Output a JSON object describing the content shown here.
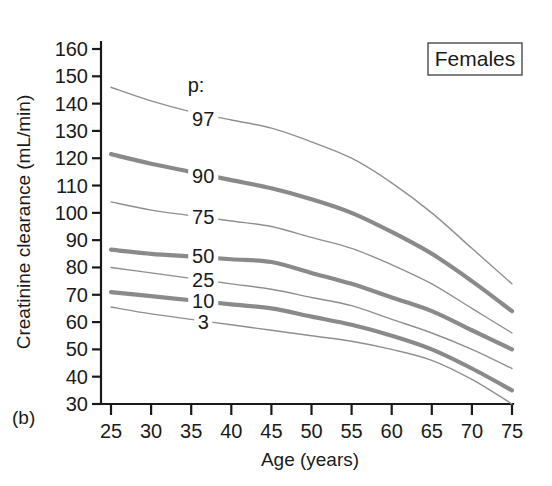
{
  "figure": {
    "panel_label": "(b)",
    "group_box_label": "Females",
    "percentile_header": "p:"
  },
  "chart_data": {
    "type": "line",
    "title": "",
    "subtitle": "",
    "xlabel": "Age (years)",
    "ylabel": "Creatinine clearance (mL/min)",
    "xlim": [
      25,
      75
    ],
    "ylim": [
      30,
      160
    ],
    "xticks": [
      25,
      30,
      35,
      40,
      45,
      50,
      55,
      60,
      65,
      70,
      75
    ],
    "yticks": [
      30,
      40,
      50,
      60,
      70,
      80,
      90,
      100,
      110,
      120,
      130,
      140,
      150,
      160
    ],
    "grid": false,
    "legend": "inline-curve-labels",
    "legend_position": "inline",
    "annotations": [
      "p:",
      "Females",
      "(b)"
    ],
    "x": [
      25,
      30,
      35,
      40,
      45,
      50,
      55,
      60,
      65,
      70,
      75
    ],
    "series": [
      {
        "name": "97",
        "label": "97",
        "emphasis": "thin",
        "color": "#8f8f8f",
        "values": [
          146,
          141,
          137,
          134,
          131,
          126,
          120,
          111,
          100,
          87,
          74
        ]
      },
      {
        "name": "90",
        "label": "90",
        "emphasis": "thick",
        "color": "#8a8a8a",
        "values": [
          121.5,
          118,
          115,
          112,
          109,
          105,
          100,
          93,
          85,
          75,
          64
        ]
      },
      {
        "name": "75",
        "label": "75",
        "emphasis": "thin",
        "color": "#8f8f8f",
        "values": [
          104,
          101,
          99,
          97,
          95,
          91,
          87,
          81,
          74,
          65,
          56
        ]
      },
      {
        "name": "50",
        "label": "50",
        "emphasis": "thick",
        "color": "#8a8a8a",
        "values": [
          86.5,
          85,
          84,
          83,
          82,
          78,
          74,
          69,
          64,
          57,
          50
        ]
      },
      {
        "name": "25",
        "label": "25",
        "emphasis": "thin",
        "color": "#8f8f8f",
        "values": [
          80,
          78,
          76,
          74,
          72,
          69,
          66,
          61,
          56,
          50,
          43
        ]
      },
      {
        "name": "10",
        "label": "10",
        "emphasis": "thick",
        "color": "#8a8a8a",
        "values": [
          71,
          69.5,
          68,
          66.5,
          65,
          62,
          59,
          55,
          50,
          43,
          35
        ]
      },
      {
        "name": "3",
        "label": "3",
        "emphasis": "thin",
        "color": "#8f8f8f",
        "values": [
          65.5,
          63,
          61,
          59,
          57,
          55,
          53,
          50,
          46,
          39,
          30
        ]
      }
    ],
    "curve_label_positions": [
      {
        "name": "97",
        "age": 36.5,
        "value": 134
      },
      {
        "name": "90",
        "age": 36.5,
        "value": 113
      },
      {
        "name": "75",
        "age": 36.5,
        "value": 98
      },
      {
        "name": "50",
        "age": 36.5,
        "value": 84
      },
      {
        "name": "25",
        "age": 36.5,
        "value": 75
      },
      {
        "name": "10",
        "age": 36.5,
        "value": 67.5
      },
      {
        "name": "3",
        "age": 36.5,
        "value": 59.5
      }
    ]
  }
}
